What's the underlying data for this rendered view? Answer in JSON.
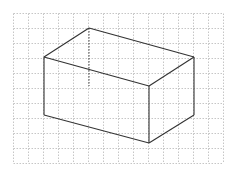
{
  "diagram": {
    "type": "cuboid-on-grid",
    "grid": {
      "x_start": 13.5,
      "y_start": 13.5,
      "spacing": 15,
      "cols": 14,
      "rows": 10,
      "color": "#b8b8b8"
    },
    "box": {
      "stroke": "#333333",
      "vertices": {
        "back_top": [
          89,
          28
        ],
        "left_top": [
          44,
          57
        ],
        "front_top": [
          149,
          86
        ],
        "right_top": [
          194,
          57
        ],
        "left_bottom": [
          44,
          115
        ],
        "front_bottom": [
          149,
          143
        ],
        "right_bottom": [
          194,
          115
        ],
        "back_bottom_hidden": [
          89,
          86
        ]
      }
    }
  }
}
